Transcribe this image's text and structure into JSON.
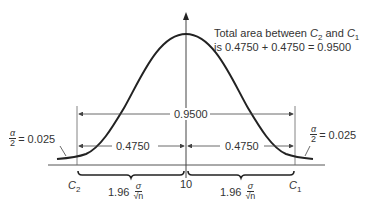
{
  "diagram": {
    "title_note_line1_prefix": "Total area between ",
    "title_note_c2": "C",
    "title_note_c2_sub": "2",
    "title_note_and": " and ",
    "title_note_c1": "C",
    "title_note_c1_sub": "1",
    "title_note_line2": "is 0.4750 + 0.4750 = 0.9500",
    "total_area_label": "0.9500",
    "left_half_label": "0.4750",
    "right_half_label": "0.4750",
    "left_tail": {
      "num": "α",
      "den": "2",
      "value": "= 0.025"
    },
    "right_tail": {
      "num": "α",
      "den": "2",
      "value": "= 0.025"
    },
    "c2_label": "C",
    "c2_sub": "2",
    "c1_label": "C",
    "c1_sub": "1",
    "center_label": "10",
    "left_width": {
      "coef": "1.96",
      "num": "σ",
      "den": "√n"
    },
    "right_width": {
      "coef": "1.96",
      "num": "σ",
      "den": "√n"
    },
    "colors": {
      "curve": "#222222",
      "lines": "#555555"
    }
  }
}
